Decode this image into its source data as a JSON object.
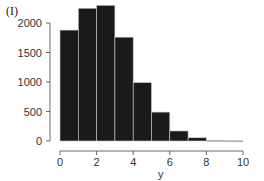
{
  "panel_label": "(I)",
  "chart_data": {
    "type": "bar",
    "title": "",
    "xlabel": "y",
    "ylabel": "",
    "bin_edges": [
      0,
      1,
      2,
      3,
      4,
      5,
      6,
      7,
      8,
      9,
      10
    ],
    "categories": [
      "0-1",
      "1-2",
      "2-3",
      "3-4",
      "4-5",
      "5-6",
      "6-7",
      "7-8",
      "8-9",
      "9-10"
    ],
    "values": [
      1880,
      2250,
      2300,
      1760,
      990,
      490,
      170,
      55,
      8,
      4
    ],
    "xlim": [
      0,
      11
    ],
    "ylim": [
      0,
      2400
    ],
    "xticks": [
      0,
      2,
      4,
      6,
      8,
      10
    ],
    "yticks": [
      0,
      500,
      1000,
      1500,
      2000
    ],
    "grid": false,
    "legend": null,
    "bar_color": "#1a1a1a",
    "edge_color": "#cccccc"
  }
}
